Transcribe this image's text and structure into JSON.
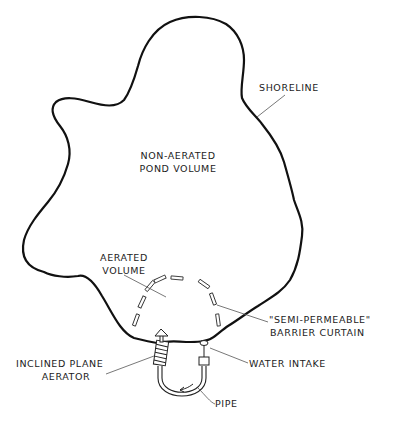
{
  "diagram": {
    "type": "pond aeration schematic",
    "labels": {
      "shoreline": "SHORELINE",
      "non_aerated_line1": "NON-AERATED",
      "non_aerated_line2": "POND  VOLUME",
      "aerated_line1": "AERATED",
      "aerated_line2": "VOLUME",
      "curtain_line1": "\"SEMI-PERMEABLE\"",
      "curtain_line2": "BARRIER  CURTAIN",
      "aerator_line1": "INCLINED PLANE",
      "aerator_line2": "AERATOR",
      "intake": "WATER  INTAKE",
      "pipe": "PIPE"
    },
    "colors": {
      "line": "#111111",
      "leader": "#444444",
      "background": "#ffffff"
    }
  }
}
